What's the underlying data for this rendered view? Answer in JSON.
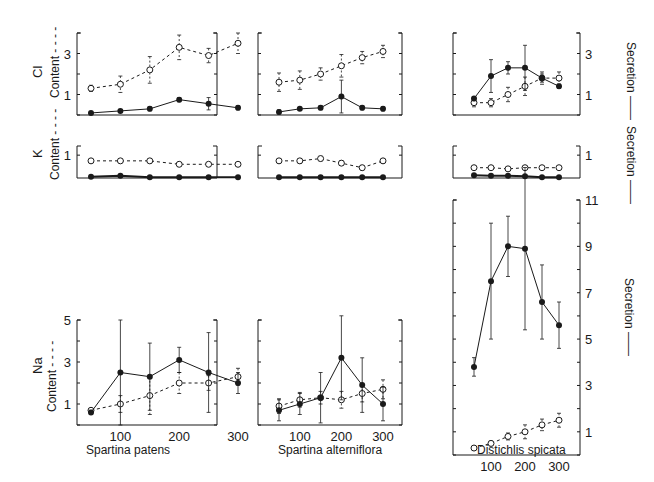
{
  "figure": {
    "x_axis_ticks": [
      "100",
      "200",
      "300"
    ],
    "species_labels": [
      "Spartina  patens",
      "Spartina alterniflora",
      "Distichlis  spicata"
    ],
    "row_labels": {
      "cl": "Cl",
      "k": "K",
      "na": "Na"
    },
    "left_axis_label": "Content",
    "right_axis_label": "Secretion",
    "content_dash": "- - - -",
    "secretion_dash": "——"
  },
  "chart_data": [
    {
      "type": "line",
      "title": "Spartina patens – Cl",
      "ion": "Cl",
      "species": "Spartina patens",
      "xlabel": "",
      "ylabel": "Content / Secretion",
      "x": [
        50,
        100,
        150,
        200,
        250,
        300
      ],
      "ylim": [
        0,
        4
      ],
      "yticks_left": [
        1,
        3
      ],
      "yticks_right": [],
      "series": [
        {
          "name": "Content",
          "style": "dashed",
          "marker": "open",
          "values": [
            1.3,
            1.5,
            2.2,
            3.3,
            2.9,
            3.5
          ],
          "err": [
            0.15,
            0.4,
            0.65,
            0.6,
            0.35,
            0.5
          ]
        },
        {
          "name": "Secretion",
          "style": "solid",
          "marker": "filled",
          "values": [
            0.1,
            0.2,
            0.3,
            0.75,
            0.55,
            0.35
          ],
          "err": [
            0.05,
            0.05,
            0.1,
            0.1,
            0.3,
            0.1
          ]
        }
      ]
    },
    {
      "type": "line",
      "title": "Spartina alterniflora – Cl",
      "ion": "Cl",
      "species": "Spartina alterniflora",
      "x": [
        50,
        100,
        150,
        200,
        250,
        300
      ],
      "ylim": [
        0,
        4
      ],
      "series": [
        {
          "name": "Content",
          "style": "dashed",
          "marker": "open",
          "values": [
            1.6,
            1.7,
            2.0,
            2.4,
            2.8,
            3.1
          ],
          "err": [
            0.45,
            0.45,
            0.3,
            0.55,
            0.3,
            0.3
          ]
        },
        {
          "name": "Secretion",
          "style": "solid",
          "marker": "filled",
          "values": [
            0.15,
            0.3,
            0.35,
            0.9,
            0.35,
            0.3
          ],
          "err": [
            0.1,
            0.05,
            0.1,
            0.8,
            0.1,
            0.1
          ]
        }
      ]
    },
    {
      "type": "line",
      "title": "Distichlis spicata – Cl",
      "ion": "Cl",
      "species": "Distichlis spicata",
      "x": [
        50,
        100,
        150,
        200,
        250,
        300
      ],
      "ylim": [
        0,
        4
      ],
      "yticks_right": [
        1,
        3
      ],
      "series": [
        {
          "name": "Content",
          "style": "dashed",
          "marker": "open",
          "values": [
            0.6,
            0.6,
            1.0,
            1.4,
            1.8,
            1.8
          ],
          "err": [
            0.2,
            0.2,
            0.35,
            0.45,
            0.3,
            0.3
          ]
        },
        {
          "name": "Secretion",
          "style": "solid",
          "marker": "filled",
          "values": [
            0.8,
            1.9,
            2.3,
            2.3,
            1.8,
            1.4
          ],
          "err": [
            0.1,
            0.8,
            0.3,
            1.1,
            0.2,
            0.1
          ]
        }
      ]
    },
    {
      "type": "line",
      "title": "Spartina patens – K",
      "ion": "K",
      "species": "Spartina patens",
      "x": [
        50,
        100,
        150,
        200,
        250,
        300
      ],
      "ylim": [
        0,
        1.4
      ],
      "yticks_left": [
        1
      ],
      "series": [
        {
          "name": "Content",
          "style": "dashed",
          "marker": "open",
          "values": [
            0.75,
            0.75,
            0.75,
            0.6,
            0.6,
            0.6
          ],
          "err": [
            0.08,
            0.08,
            0.08,
            0.08,
            0.08,
            0.08
          ]
        },
        {
          "name": "Secretion",
          "style": "solid",
          "marker": "filled",
          "values": [
            0.05,
            0.1,
            0.03,
            0.03,
            0.03,
            0.03
          ],
          "err": [
            0,
            0,
            0,
            0,
            0,
            0
          ]
        }
      ]
    },
    {
      "type": "line",
      "title": "Spartina alterniflora – K",
      "ion": "K",
      "species": "Spartina alterniflora",
      "x": [
        50,
        100,
        150,
        200,
        250,
        300
      ],
      "ylim": [
        0,
        1.4
      ],
      "series": [
        {
          "name": "Content",
          "style": "dashed",
          "marker": "open",
          "values": [
            0.75,
            0.75,
            0.85,
            0.65,
            0.45,
            0.75
          ],
          "err": [
            0.1,
            0.1,
            0.1,
            0.1,
            0.1,
            0.1
          ]
        },
        {
          "name": "Secretion",
          "style": "solid",
          "marker": "filled",
          "values": [
            0.03,
            0.03,
            0.03,
            0.03,
            0.03,
            0.03
          ],
          "err": [
            0,
            0,
            0,
            0,
            0,
            0
          ]
        }
      ]
    },
    {
      "type": "line",
      "title": "Distichlis spicata – K",
      "ion": "K",
      "species": "Distichlis spicata",
      "x": [
        50,
        100,
        150,
        200,
        250,
        300
      ],
      "ylim": [
        0,
        1.4
      ],
      "yticks_right": [
        1
      ],
      "series": [
        {
          "name": "Content",
          "style": "dashed",
          "marker": "open",
          "values": [
            0.45,
            0.45,
            0.4,
            0.45,
            0.45,
            0.45
          ],
          "err": [
            0.08,
            0.08,
            0.08,
            0.08,
            0.08,
            0.08
          ]
        },
        {
          "name": "Secretion",
          "style": "solid",
          "marker": "filled",
          "values": [
            0.12,
            0.1,
            0.1,
            0.08,
            0.03,
            0.03
          ],
          "err": [
            0,
            0,
            0,
            0,
            0,
            0
          ]
        }
      ]
    },
    {
      "type": "line",
      "title": "Spartina patens – Na",
      "ion": "Na",
      "species": "Spartina patens",
      "x": [
        50,
        100,
        150,
        200,
        250,
        300
      ],
      "ylim": [
        0,
        5
      ],
      "yticks_left": [
        1,
        3,
        5
      ],
      "series": [
        {
          "name": "Content",
          "style": "dashed",
          "marker": "open",
          "values": [
            0.7,
            1.0,
            1.4,
            2.0,
            2.0,
            2.3
          ],
          "err": [
            0.1,
            0.4,
            0.9,
            0.5,
            0.35,
            0.4
          ]
        },
        {
          "name": "Secretion",
          "style": "solid",
          "marker": "filled",
          "values": [
            0.6,
            2.5,
            2.3,
            3.1,
            2.5,
            2.0
          ],
          "err": [
            0.1,
            2.5,
            1.6,
            0.6,
            1.9,
            0.5
          ]
        }
      ]
    },
    {
      "type": "line",
      "title": "Spartina alterniflora – Na",
      "ion": "Na",
      "species": "Spartina alterniflora",
      "x": [
        50,
        100,
        150,
        200,
        250,
        300
      ],
      "ylim": [
        0,
        5
      ],
      "series": [
        {
          "name": "Content",
          "style": "dashed",
          "marker": "open",
          "values": [
            0.9,
            1.2,
            1.3,
            1.2,
            1.5,
            1.7
          ],
          "err": [
            0.35,
            0.35,
            0.3,
            0.4,
            0.4,
            0.45
          ]
        },
        {
          "name": "Secretion",
          "style": "solid",
          "marker": "filled",
          "values": [
            0.7,
            1.0,
            1.3,
            3.2,
            1.9,
            1.0
          ],
          "err": [
            0.5,
            0.5,
            1.2,
            2.0,
            1.3,
            0.8
          ]
        }
      ]
    },
    {
      "type": "line",
      "title": "Distichlis spicata – Na",
      "ion": "Na",
      "species": "Distichlis spicata",
      "x": [
        50,
        100,
        150,
        200,
        250,
        300
      ],
      "ylim": [
        0,
        11
      ],
      "yticks_right": [
        1,
        3,
        5,
        7,
        9,
        11
      ],
      "series": [
        {
          "name": "Content",
          "style": "dashed",
          "marker": "open",
          "values": [
            0.3,
            0.5,
            0.8,
            1.0,
            1.3,
            1.5
          ],
          "err": [
            0.1,
            0.1,
            0.15,
            0.3,
            0.25,
            0.3
          ]
        },
        {
          "name": "Secretion",
          "style": "solid",
          "marker": "filled",
          "values": [
            3.8,
            7.5,
            9.0,
            8.9,
            6.6,
            5.6
          ],
          "err": [
            0.4,
            2.5,
            1.3,
            3.5,
            1.6,
            1.0
          ]
        }
      ]
    }
  ]
}
